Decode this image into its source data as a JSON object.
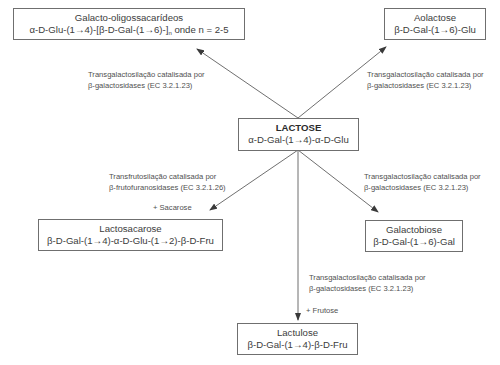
{
  "diagram": {
    "center": {
      "name": "LACTOSE",
      "formula": "α-D-Gal-(1→4)-α-D-Glu"
    },
    "products": [
      {
        "id": "galacto-oligossacarideos",
        "name": "Galacto-oligossacarídeos",
        "formula_prefix": "α-D-Glu-(1→4)-[β-D-Gal-(1→6)-]",
        "formula_sub": "n",
        "formula_suffix": " onde n = 2-5",
        "reaction": [
          "Transgalactosilação catalisada por",
          "β-galactosidases (EC 3.2.1.23)"
        ],
        "cosubstrate": ""
      },
      {
        "id": "aolactose",
        "name": "Aolactose",
        "formula": "β-D-Gal-(1→6)-Glu",
        "reaction": [
          "Transgalactosilação catalisada por",
          "β-galactosidases (EC 3.2.1.23)"
        ],
        "cosubstrate": ""
      },
      {
        "id": "lactosacarose",
        "name": "Lactosacarose",
        "formula": "β-D-Gal-(1→4)-α-D-Glu-(1→2)-β-D-Fru",
        "reaction": [
          "Transfrutosilação catalisada por",
          "β-frutofuranosidases (EC 3.2.1.26)"
        ],
        "cosubstrate": "+ Sacarose"
      },
      {
        "id": "galactobiose",
        "name": "Galactobiose",
        "formula": "β-D-Gal-(1→6)-Gal",
        "reaction": [
          "Transgalactosilação catalisada por",
          "β-galactosidases (EC 3.2.1.23)"
        ],
        "cosubstrate": ""
      },
      {
        "id": "lactulose",
        "name": "Lactulose",
        "formula": "β-D-Gal-(1→4)-β-D-Fru",
        "reaction": [
          "Transgalactosilação catalisada por",
          "β-galactosidases (EC 3.2.1.23)"
        ],
        "cosubstrate": "+ Frutose"
      }
    ],
    "colors": {
      "line": "#4a4a4a",
      "box_border": "#6f6f6f",
      "text": "#3c3c3c"
    }
  }
}
